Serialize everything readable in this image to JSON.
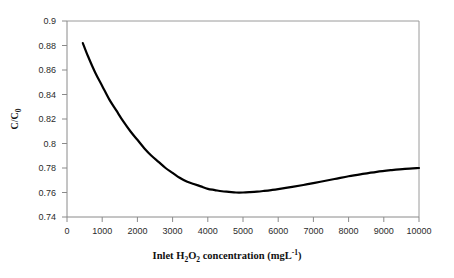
{
  "chart_data": {
    "type": "line",
    "title": "",
    "xlabel": "Inlet H2O2 concentration (mgL-1)",
    "ylabel": "C/C0",
    "xlim": [
      0,
      10000
    ],
    "ylim": [
      0.74,
      0.9
    ],
    "grid": false,
    "legend": null,
    "xticks": [
      0,
      1000,
      2000,
      3000,
      4000,
      5000,
      6000,
      7000,
      8000,
      9000,
      10000
    ],
    "xtick_labels": [
      "0",
      "1000",
      "2000",
      "3000",
      "4000",
      "5000",
      "6000",
      "7000",
      "8000",
      "9000",
      "10000"
    ],
    "yticks": [
      0.74,
      0.76,
      0.78,
      0.8,
      0.82,
      0.84,
      0.86,
      0.88,
      0.9
    ],
    "ytick_labels": [
      "0.74",
      "0.76",
      "0.78",
      "0.8",
      "0.82",
      "0.84",
      "0.86",
      "0.88",
      "0.9"
    ],
    "series": [
      {
        "name": "C/C0 vs inlet H2O2 concentration",
        "color": "#000000",
        "line_width": 2.2,
        "x": [
          450,
          600,
          800,
          1000,
          1200,
          1400,
          1600,
          1800,
          2000,
          2200,
          2400,
          2600,
          2800,
          3000,
          3200,
          3400,
          3600,
          3800,
          4000,
          4200,
          4400,
          4600,
          4800,
          5000,
          5200,
          5400,
          5600,
          5800,
          6000,
          6400,
          6800,
          7200,
          7600,
          8000,
          8400,
          8800,
          9200,
          9600,
          10000
        ],
        "y": [
          0.882,
          0.871,
          0.858,
          0.847,
          0.836,
          0.827,
          0.818,
          0.81,
          0.803,
          0.796,
          0.79,
          0.785,
          0.78,
          0.776,
          0.772,
          0.769,
          0.767,
          0.765,
          0.763,
          0.762,
          0.761,
          0.7605,
          0.76,
          0.76,
          0.7603,
          0.7607,
          0.7613,
          0.762,
          0.7628,
          0.7646,
          0.7666,
          0.7688,
          0.771,
          0.7733,
          0.7752,
          0.7769,
          0.7782,
          0.7793,
          0.78
        ]
      }
    ],
    "annotations": {
      "minimum_value": 0.76,
      "minimum_at_x": 4900,
      "start_value": 0.882,
      "start_at_x": 450,
      "end_value": 0.78,
      "end_at_x": 10000
    }
  },
  "axis_titles": {
    "x_prefix": "Inlet H",
    "x_sub1": "2",
    "x_mid": "O",
    "x_sub2": "2",
    "x_suffix": " concentration (mgL",
    "x_sup": "-1",
    "x_close": ")",
    "y_main": "C/C",
    "y_sub": "0"
  },
  "style": {
    "axis_color": "#808080",
    "curve_color": "#000000",
    "tick_text_color": "#2b2b2b",
    "background": "#ffffff"
  }
}
